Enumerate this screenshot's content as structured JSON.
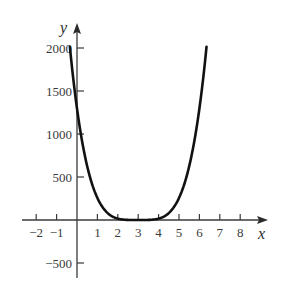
{
  "chart_data": {
    "type": "line",
    "title": "",
    "xlabel": "x",
    "ylabel": "y",
    "function_estimate": "y = 16(x - 3)^4",
    "x_ticks": [
      -2,
      -1,
      1,
      2,
      3,
      4,
      5,
      6,
      7,
      8
    ],
    "x_tick_labels": [
      "−2",
      "−1",
      "1",
      "2",
      "3",
      "4",
      "5",
      "6",
      "7",
      "8"
    ],
    "y_ticks": [
      2000,
      1500,
      1000,
      500,
      -500
    ],
    "y_tick_labels": [
      "2000",
      "1500",
      "1000",
      "500",
      "−500"
    ],
    "xlim": [
      -2.5,
      9
    ],
    "ylim": [
      -700,
      2250
    ],
    "grid": false,
    "legend": null,
    "series": [
      {
        "name": "curve",
        "x": [
          -0.35,
          0,
          0.5,
          1,
          1.5,
          2,
          2.5,
          3,
          3.5,
          4,
          4.5,
          5,
          5.5,
          6,
          6.35
        ],
        "values": [
          2015,
          1296,
          625,
          256,
          81,
          16,
          1,
          0,
          1,
          16,
          81,
          256,
          625,
          1296,
          2015
        ],
        "color": "#111111"
      }
    ]
  },
  "colors": {
    "axis": "#3a3a3a",
    "curve": "#111111",
    "background": "#ffffff"
  }
}
